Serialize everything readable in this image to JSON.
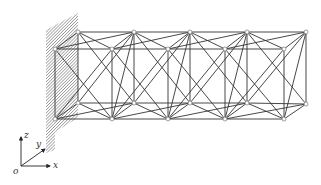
{
  "figure": {
    "type": "space-truss-cantilever",
    "bays": 4,
    "colors": {
      "member": "#333333",
      "node_fill": "#ffffff",
      "node_stroke": "#777777",
      "wall_hatch": "#555555"
    }
  },
  "nodes": {
    "back_top": [
      [
        78,
        32
      ],
      [
        134,
        32
      ],
      [
        190,
        32
      ],
      [
        247,
        32
      ],
      [
        306,
        32
      ]
    ],
    "front_top": [
      [
        55,
        49
      ],
      [
        112,
        49
      ],
      [
        168,
        49
      ],
      [
        225,
        49
      ],
      [
        284,
        49
      ]
    ],
    "back_bottom": [
      [
        78,
        103
      ],
      [
        134,
        103
      ],
      [
        190,
        103
      ],
      [
        247,
        103
      ],
      [
        306,
        104
      ]
    ],
    "front_bottom": [
      [
        55,
        119
      ],
      [
        112,
        119
      ],
      [
        168,
        119
      ],
      [
        225,
        119
      ],
      [
        284,
        119
      ]
    ]
  },
  "axes": {
    "origin_label": "o",
    "x_label": "x",
    "y_label": "y",
    "z_label": "z"
  }
}
